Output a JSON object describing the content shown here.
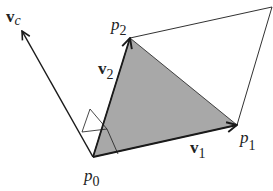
{
  "diagram": {
    "colors": {
      "triangle_fill": "#a8a8a8",
      "stroke": "#1a1a1a",
      "background": "#ffffff"
    },
    "points": {
      "p0": {
        "x": 93,
        "y": 157
      },
      "p1": {
        "x": 237,
        "y": 125
      },
      "p2": {
        "x": 130,
        "y": 38
      },
      "p3": {
        "x": 272,
        "y": 7
      },
      "vc_tip": {
        "x": 22,
        "y": 31
      }
    },
    "labels": {
      "vc": {
        "main": "v",
        "sub": "c"
      },
      "p2": {
        "main": "p",
        "sub": "2"
      },
      "v2": {
        "main": "v",
        "sub": "2"
      },
      "p0": {
        "main": "p",
        "sub": "0"
      },
      "v1": {
        "main": "v",
        "sub": "1"
      },
      "p1": {
        "main": "p",
        "sub": "1"
      }
    }
  }
}
